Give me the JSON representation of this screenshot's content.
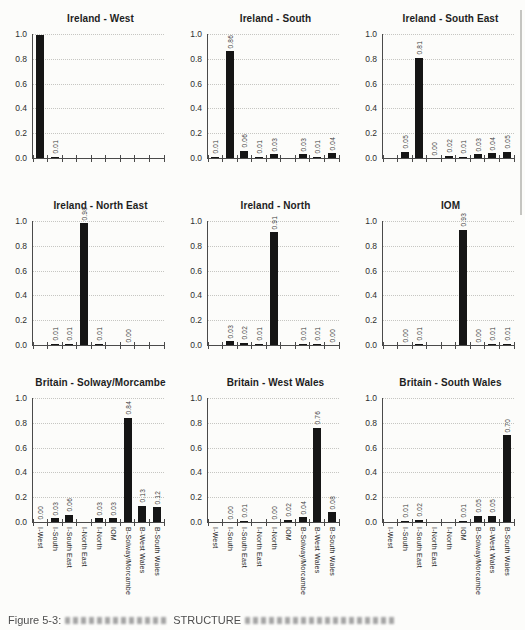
{
  "figure": {
    "caption": {
      "prefix": "Figure 5-3:",
      "fragment": "STRUCTURE"
    }
  },
  "axis": {
    "categories": [
      "I-West",
      "I-South",
      "I-South East",
      "I-North East",
      "I-North",
      "IOM",
      "B-Solway/Morcambe",
      "B-West Wales",
      "B-South Wales"
    ],
    "yticks": [
      "1.0",
      "0.8",
      "0.6",
      "0.4",
      "0.2",
      "0.0"
    ],
    "ylim": [
      0,
      1
    ]
  },
  "colors": {
    "bar": "#151515",
    "grid": "#c6c6c2",
    "axis": "#4a4a4a",
    "background": "#fcfcfa"
  },
  "chart_data": [
    {
      "type": "bar",
      "title": "Ireland - West",
      "values": [
        0.99,
        0.01,
        null,
        null,
        null,
        null,
        null,
        null,
        null
      ],
      "labels": [
        null,
        "0.01",
        null,
        null,
        null,
        null,
        null,
        null,
        null
      ],
      "show_x_labels": false
    },
    {
      "type": "bar",
      "title": "Ireland - South",
      "values": [
        0.01,
        0.86,
        0.06,
        0.01,
        0.03,
        null,
        0.03,
        0.01,
        0.04
      ],
      "show_x_labels": false
    },
    {
      "type": "bar",
      "title": "Ireland - South East",
      "values": [
        null,
        0.05,
        0.81,
        0.0,
        0.02,
        0.01,
        0.03,
        0.04,
        0.05
      ],
      "show_x_labels": false
    },
    {
      "type": "bar",
      "title": "Ireland - North East",
      "values": [
        null,
        0.01,
        0.01,
        0.98,
        0.01,
        null,
        0.0,
        null,
        null
      ],
      "show_x_labels": false
    },
    {
      "type": "bar",
      "title": "Ireland - North",
      "values": [
        null,
        0.03,
        0.02,
        0.01,
        0.91,
        null,
        0.01,
        0.01,
        0.0
      ],
      "show_x_labels": false
    },
    {
      "type": "bar",
      "title": "IOM",
      "values": [
        null,
        0.0,
        0.01,
        null,
        null,
        0.93,
        0.0,
        0.01,
        0.01
      ],
      "show_x_labels": false
    },
    {
      "type": "bar",
      "title": "Britain - Solway/Morcambe",
      "values": [
        0.0,
        0.03,
        0.06,
        null,
        0.03,
        0.03,
        0.84,
        0.13,
        0.12
      ],
      "show_x_labels": true
    },
    {
      "type": "bar",
      "title": "Britain - West Wales",
      "values": [
        null,
        0.0,
        0.01,
        null,
        0.0,
        0.02,
        0.04,
        0.76,
        0.08
      ],
      "show_x_labels": true
    },
    {
      "type": "bar",
      "title": "Britain - South Wales",
      "values": [
        null,
        0.01,
        0.02,
        null,
        null,
        0.01,
        0.05,
        0.05,
        0.7
      ],
      "show_x_labels": true
    }
  ]
}
